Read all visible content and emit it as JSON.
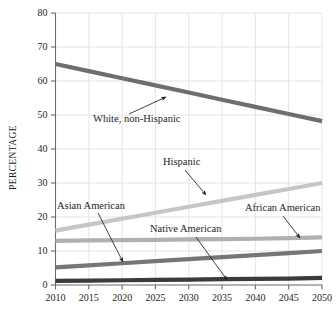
{
  "chart_data": {
    "type": "line",
    "title": "",
    "xlabel": "",
    "ylabel": "PERCENTAGE",
    "x": [
      2010,
      2015,
      2020,
      2025,
      2030,
      2035,
      2040,
      2045,
      2050
    ],
    "xtick_labels": [
      "2010",
      "2015",
      "2020",
      "2025",
      "2030",
      "2035",
      "2040",
      "2045",
      "2050"
    ],
    "xlim": [
      2010,
      2050
    ],
    "ytick_labels": [
      "0",
      "10",
      "20",
      "30",
      "40",
      "50",
      "60",
      "70",
      "80"
    ],
    "yticks": [
      0,
      10,
      20,
      30,
      40,
      50,
      60,
      70,
      80
    ],
    "ylim": [
      0,
      80
    ],
    "grid": true,
    "legend_position": "inline-annotations",
    "series": [
      {
        "name": "White, non-Hispanic",
        "color": "#6e6e6e",
        "values": [
          65.0,
          62.9,
          60.8,
          58.7,
          56.6,
          54.5,
          52.4,
          50.3,
          48.2
        ]
      },
      {
        "name": "Hispanic",
        "color": "#c6c6c6",
        "values": [
          16.0,
          17.75,
          19.5,
          21.25,
          23.0,
          24.75,
          26.5,
          28.25,
          30.0
        ]
      },
      {
        "name": "African American",
        "color": "#b0b0b0",
        "values": [
          13.0,
          13.1,
          13.2,
          13.3,
          13.4,
          13.5,
          13.6,
          13.8,
          14.0
        ]
      },
      {
        "name": "Asian American",
        "color": "#767676",
        "values": [
          5.2,
          5.8,
          6.4,
          7.0,
          7.6,
          8.2,
          8.8,
          9.4,
          10.0
        ]
      },
      {
        "name": "Native American",
        "color": "#3b3b3b",
        "values": [
          1.2,
          1.3,
          1.4,
          1.5,
          1.6,
          1.7,
          1.8,
          1.9,
          2.1
        ]
      }
    ],
    "annotations": [
      {
        "text": "White, non-Hispanic",
        "label_x": 93,
        "label_y": 122,
        "arrow_from_x": 129,
        "arrow_from_y": 114,
        "arrow_to_x": 166,
        "arrow_to_y": 97
      },
      {
        "text": "Hispanic",
        "label_x": 163,
        "label_y": 165,
        "arrow_from_x": 185,
        "arrow_from_y": 170,
        "arrow_to_x": 206,
        "arrow_to_y": 195
      },
      {
        "text": "Asian American",
        "label_x": 57,
        "label_y": 209,
        "arrow_from_x": 98,
        "arrow_from_y": 213,
        "arrow_to_x": 123,
        "arrow_to_y": 262
      },
      {
        "text": "Native American",
        "label_x": 150,
        "label_y": 232,
        "arrow_from_x": 196,
        "arrow_from_y": 237,
        "arrow_to_x": 227,
        "arrow_to_y": 280
      },
      {
        "text": "African American",
        "label_x": 245,
        "label_y": 211,
        "arrow_from_x": 283,
        "arrow_from_y": 216,
        "arrow_to_x": 300,
        "arrow_to_y": 238
      }
    ]
  },
  "colors": {
    "axis": "#6b6b6b",
    "grid": "#e2e2e2",
    "text": "#231f20",
    "background": "#ffffff"
  }
}
